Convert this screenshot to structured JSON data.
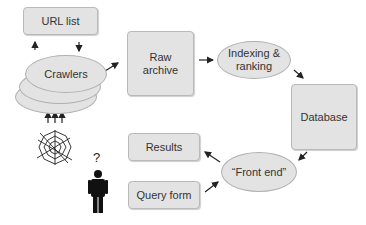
{
  "diagram": {
    "nodes": {
      "url_list": "URL list",
      "crawlers": "Crawlers",
      "raw_archive": "Raw\narchive",
      "indexing": "Indexing &\nranking",
      "database": "Database",
      "front_end": "“Front end”",
      "results": "Results",
      "query_form": "Query form"
    },
    "icons": {
      "web": "spider-web-icon",
      "user": "person-icon",
      "question": "?"
    },
    "colors": {
      "node_fill": "#e3e3e3",
      "node_border": "#b9b9b9",
      "arrow": "#222222"
    },
    "edges": [
      [
        "web",
        "crawlers"
      ],
      [
        "crawlers",
        "url_list"
      ],
      [
        "url_list",
        "crawlers"
      ],
      [
        "crawlers",
        "raw_archive"
      ],
      [
        "raw_archive",
        "indexing"
      ],
      [
        "indexing",
        "database"
      ],
      [
        "database",
        "front_end"
      ],
      [
        "front_end",
        "results"
      ],
      [
        "query_form",
        "front_end"
      ]
    ]
  }
}
